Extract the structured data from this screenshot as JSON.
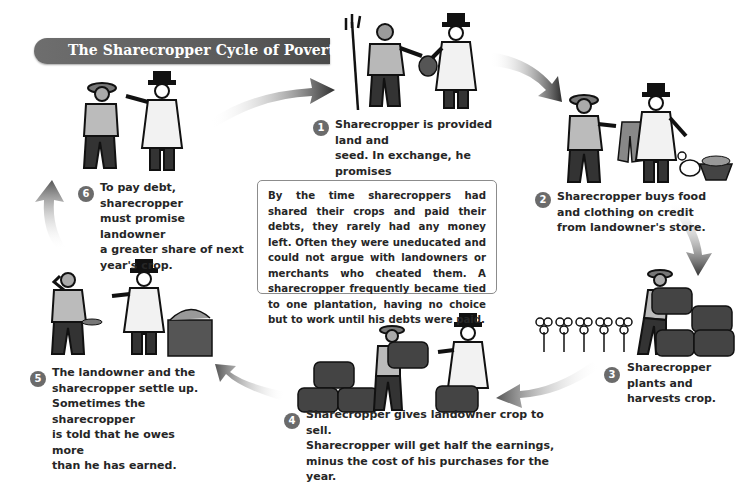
{
  "title": "The Sharecropper Cycle of Poverty",
  "info_box": {
    "text": "By the time sharecroppers had shared their crops and paid their debts, they rarely had any money left. Often they were uneducated and could not argue with landowners or merchants who cheated them. A sharecropper frequently became tied to one plantation, having no choice but to work until his debts were paid."
  },
  "steps": [
    {
      "number": "1",
      "lines": [
        "Sharecropper is provided land and",
        "seed. In exchange, he promises",
        "landowner half the crop."
      ],
      "illustration": "sharecropper-with-pitchfork-receives-seed-bag-from-landowner"
    },
    {
      "number": "2",
      "lines": [
        "Sharecropper buys food",
        "and clothing on credit",
        "from landowner's store."
      ],
      "illustration": "sharecropper-receives-coat-from-landowner-with-rooster-and-basket"
    },
    {
      "number": "3",
      "lines": [
        "Sharecropper",
        "plants and",
        "harvests crop."
      ],
      "illustration": "sharecropper-stacking-bales-beside-cotton-plants"
    },
    {
      "number": "4",
      "lines": [
        "Sharecropper gives landowner crop to sell.",
        "Sharecropper will get half the earnings,",
        "minus the cost of his purchases for the year."
      ],
      "illustration": "sharecropper-carries-bale-to-landowner"
    },
    {
      "number": "5",
      "lines": [
        "The landowner and the",
        "sharecropper settle up.",
        "Sometimes the sharecropper",
        "is told that he owes more",
        "than he has earned."
      ],
      "illustration": "landowner-beside-money-table-sharecropper-scratching-head"
    },
    {
      "number": "6",
      "lines": [
        "To pay debt, sharecropper",
        "must promise landowner",
        "a greater share of next",
        "year's crop."
      ],
      "illustration": "landowner-pointing-at-sharecropper"
    }
  ],
  "colors": {
    "title_bar": "#5a5a5a",
    "badge": "#6b6b6b",
    "arrow_dark": "#3a3a3a",
    "text": "#262626",
    "box_border": "#8c8c8c"
  }
}
